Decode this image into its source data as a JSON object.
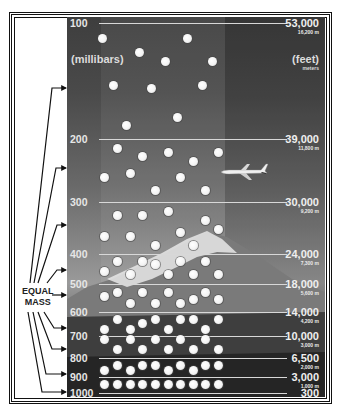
{
  "diagram": {
    "left_units": "(millibars)",
    "right_units": "(feet)",
    "right_sub_units": "meters",
    "equal_mass_label_1": "EQUAL",
    "equal_mass_label_2": "MASS",
    "levels": [
      {
        "pressure_mb": "100",
        "feet": "53,000",
        "meters": "16,200 m"
      },
      {
        "pressure_mb": "200",
        "feet": "39,000",
        "meters": "11,800 m"
      },
      {
        "pressure_mb": "300",
        "feet": "30,000",
        "meters": "9,200 m"
      },
      {
        "pressure_mb": "400",
        "feet": "24,000",
        "meters": "7,300 m"
      },
      {
        "pressure_mb": "500",
        "feet": "18,000",
        "meters": "5,600 m"
      },
      {
        "pressure_mb": "600",
        "feet": "14,000",
        "meters": "4,200 m"
      },
      {
        "pressure_mb": "700",
        "feet": "10,000",
        "meters": "3,000 m"
      },
      {
        "pressure_mb": "800",
        "feet": "6,500",
        "meters": "2,000 m"
      },
      {
        "pressure_mb": "900",
        "feet": "3,000",
        "meters": "1,000 m"
      },
      {
        "pressure_mb": "1000",
        "feet": "300",
        "meters": ""
      }
    ],
    "icons": {
      "aircraft": "airplane-icon",
      "molecule": "air-molecule-dot",
      "terrain": "mountain-image"
    },
    "colors": {
      "panel_top": "#3e3e3e",
      "panel_mid": "#9a9a9a",
      "panel_bottom": "#1e1e1e",
      "line": "#d8d8d8",
      "dot": "#f4f4f4"
    }
  }
}
